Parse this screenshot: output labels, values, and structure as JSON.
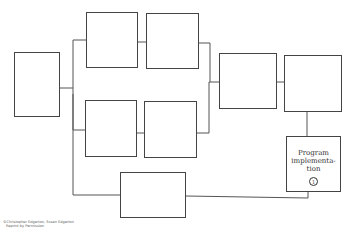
{
  "diagram": {
    "nodes": [
      {
        "id": "n1",
        "label": ""
      },
      {
        "id": "n2",
        "label": ""
      },
      {
        "id": "n3",
        "label": ""
      },
      {
        "id": "n4",
        "label": ""
      },
      {
        "id": "n5",
        "label": ""
      },
      {
        "id": "n6",
        "label": ""
      },
      {
        "id": "n7",
        "label": ""
      },
      {
        "id": "n8",
        "label": "Program implementa-tion",
        "number": "1"
      },
      {
        "id": "n9",
        "label": ""
      }
    ],
    "program_label_lines": [
      "Program",
      "implementa-",
      "tion"
    ],
    "program_number": "1"
  },
  "credit": {
    "line1": "©Christopher Edgerton, Susan Edgerton",
    "line2": "Reprint by Permission"
  }
}
